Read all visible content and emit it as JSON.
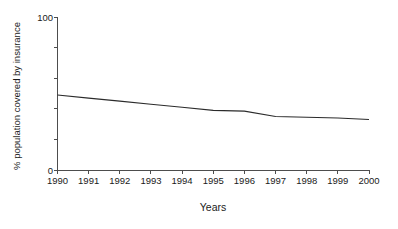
{
  "chart_data": {
    "type": "line",
    "title": "",
    "subtitle": "",
    "xlabel": "Years",
    "ylabel": "% population covered by insurance",
    "x": [
      1990,
      1991,
      1992,
      1993,
      1994,
      1995,
      1996,
      1997,
      1998,
      1999,
      2000
    ],
    "categories": [
      "1990",
      "1991",
      "1992",
      "1993",
      "1994",
      "1995",
      "1996",
      "1997",
      "1998",
      "1999",
      "2000"
    ],
    "series": [
      {
        "name": "% population covered by insurance",
        "values": [
          49,
          47,
          45,
          43,
          41,
          39,
          38.5,
          35,
          34.5,
          34,
          33
        ],
        "color": "#2b2b2b"
      }
    ],
    "xlim": [
      1990,
      2000
    ],
    "ylim": [
      0,
      100
    ],
    "y_tick_labels": [
      "0",
      "100"
    ],
    "y_ticks_labeled": [
      0,
      100
    ],
    "y_ticks_unlabeled": [
      20,
      40,
      60,
      80
    ],
    "x_tick_labels": [
      "1990",
      "1991",
      "1992",
      "1993",
      "1994",
      "1995",
      "1996",
      "1997",
      "1998",
      "1999",
      "2000"
    ],
    "grid": false,
    "legend": false,
    "legend_position": "none",
    "line_color": "#2b2b2b",
    "axis_color": "#4d4d4d",
    "background_color": "#ffffff"
  }
}
